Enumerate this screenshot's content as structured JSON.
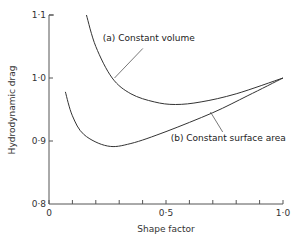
{
  "chart_data": {
    "type": "line",
    "title": "",
    "xlabel": "Shape factor",
    "ylabel": "Hydrodynamic drag",
    "xlim": [
      0,
      1.0
    ],
    "ylim": [
      0.8,
      1.1
    ],
    "grid": false,
    "legend": "inline annotations",
    "x_ticks": [
      {
        "value": 0,
        "label": "0"
      },
      {
        "value": 0.1,
        "label": ""
      },
      {
        "value": 0.2,
        "label": ""
      },
      {
        "value": 0.3,
        "label": ""
      },
      {
        "value": 0.4,
        "label": ""
      },
      {
        "value": 0.5,
        "label": "0·5"
      },
      {
        "value": 0.6,
        "label": ""
      },
      {
        "value": 0.7,
        "label": ""
      },
      {
        "value": 0.8,
        "label": ""
      },
      {
        "value": 0.9,
        "label": ""
      },
      {
        "value": 1.0,
        "label": "1·0"
      }
    ],
    "y_ticks": [
      {
        "value": 0.8,
        "label": "0·8"
      },
      {
        "value": 0.9,
        "label": "0·9"
      },
      {
        "value": 1.0,
        "label": "1·0"
      },
      {
        "value": 1.1,
        "label": "1·1"
      }
    ],
    "series": [
      {
        "name": "(a) Constant volume",
        "x": [
          0.16,
          0.2,
          0.27,
          0.35,
          0.45,
          0.54,
          0.65,
          0.8,
          1.0
        ],
        "y": [
          1.1,
          1.05,
          1.0,
          0.975,
          0.962,
          0.958,
          0.962,
          0.975,
          1.0
        ]
      },
      {
        "name": "(b) Constant surface area",
        "x": [
          0.07,
          0.1,
          0.15,
          0.25,
          0.35,
          0.5,
          0.7,
          0.85,
          1.0
        ],
        "y": [
          0.978,
          0.94,
          0.91,
          0.892,
          0.896,
          0.915,
          0.945,
          0.972,
          1.0
        ]
      }
    ],
    "annotations": [
      {
        "text": "(a) Constant volume",
        "series": 0,
        "label_pos": [
          0.23,
          1.058
        ],
        "points_to": [
          0.28,
          1.0
        ]
      },
      {
        "text": "(b) Constant surface area",
        "series": 1,
        "label_pos": [
          0.52,
          0.9
        ],
        "points_to": [
          0.69,
          0.946
        ]
      }
    ]
  }
}
